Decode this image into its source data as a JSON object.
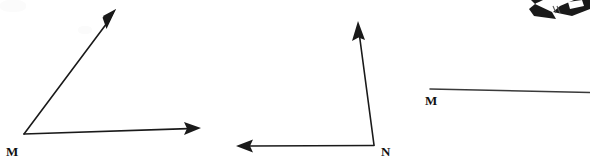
{
  "figure": {
    "background_color": "#ffffff",
    "stroke_color": "#1a1a1a",
    "stroke_width": 1.6,
    "width": 590,
    "height": 165,
    "angles": [
      {
        "id": "angle-m",
        "vertex_label": "M",
        "vertex_label_x": 6,
        "vertex_label_y": 145,
        "vertex": [
          24,
          134
        ],
        "rays": [
          {
            "id": "ray-m-upper",
            "direction": "up-right",
            "from": [
              24,
              134
            ],
            "to": [
              116,
              10
            ],
            "arrowhead": "end"
          },
          {
            "id": "ray-m-lower",
            "direction": "right",
            "from": [
              24,
              134
            ],
            "to": [
              200,
              128
            ],
            "arrowhead": "end"
          }
        ]
      },
      {
        "id": "angle-n",
        "vertex_label": "N",
        "vertex_label_x": 381,
        "vertex_label_y": 145,
        "vertex": [
          374,
          145
        ],
        "rays": [
          {
            "id": "ray-n-upper",
            "direction": "up",
            "from": [
              374,
              145
            ],
            "to": [
              358,
              22
            ],
            "arrowhead": "end"
          },
          {
            "id": "ray-n-left",
            "direction": "left",
            "from": [
              374,
              145
            ],
            "to": [
              236,
              146
            ],
            "arrowhead": "end"
          }
        ]
      },
      {
        "id": "angle-m-partial",
        "vertex_label": "M",
        "vertex_label_x": 425,
        "vertex_label_y": 94,
        "vertex": [
          430,
          89
        ],
        "rays": [
          {
            "id": "ray-m2-right",
            "direction": "right",
            "from": [
              430,
              89
            ],
            "to": [
              590,
              92
            ],
            "arrowhead": "none"
          }
        ]
      }
    ],
    "cropped_artifact": {
      "id": "cropped-arrow-fragment",
      "description": "partially cropped dark arrowhead fragment at top right edge",
      "x": 525,
      "y": 0,
      "width": 60,
      "height": 22
    }
  }
}
